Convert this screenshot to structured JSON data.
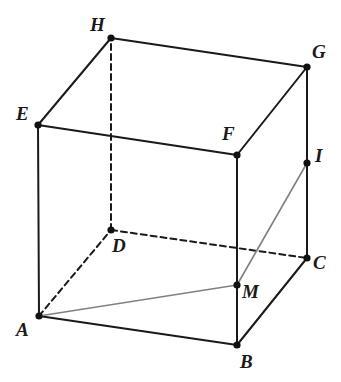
{
  "figure": {
    "width": 341,
    "height": 382,
    "background_color": "#ffffff",
    "solid_edge_color": "#1a1a1a",
    "hidden_edge_color": "#1a1a1a",
    "auxiliary_line_color": "#808080",
    "vertex_dot_color": "#111111",
    "label_color": "#1a1a1a"
  },
  "vertices": [
    {
      "id": "A",
      "label": "A",
      "x": 39,
      "y": 316,
      "label_x": 16,
      "label_y": 320,
      "dot": true
    },
    {
      "id": "B",
      "label": "B",
      "x": 237,
      "y": 345,
      "label_x": 240,
      "label_y": 352,
      "dot": true
    },
    {
      "id": "C",
      "label": "C",
      "x": 307,
      "y": 258,
      "label_x": 313,
      "label_y": 253,
      "dot": true
    },
    {
      "id": "D",
      "label": "D",
      "x": 111,
      "y": 230,
      "label_x": 112,
      "label_y": 236,
      "dot": true
    },
    {
      "id": "E",
      "label": "E",
      "x": 38,
      "y": 125,
      "label_x": 16,
      "label_y": 104,
      "dot": true
    },
    {
      "id": "F",
      "label": "F",
      "x": 237,
      "y": 155,
      "label_x": 222,
      "label_y": 124,
      "dot": true
    },
    {
      "id": "G",
      "label": "G",
      "x": 307,
      "y": 67,
      "label_x": 312,
      "label_y": 42,
      "dot": true
    },
    {
      "id": "H",
      "label": "H",
      "x": 111,
      "y": 38,
      "label_x": 90,
      "label_y": 15,
      "dot": true
    },
    {
      "id": "I",
      "label": "I",
      "x": 307,
      "y": 163,
      "label_x": 315,
      "label_y": 146,
      "dot": true
    },
    {
      "id": "M",
      "label": "M",
      "x": 237,
      "y": 285,
      "label_x": 242,
      "label_y": 282,
      "dot": true
    }
  ],
  "edges": {
    "solid": [
      {
        "name": "edge-A-B",
        "from": "A",
        "to": "B"
      },
      {
        "name": "edge-B-C",
        "from": "B",
        "to": "C"
      },
      {
        "name": "edge-A-E",
        "from": "A",
        "to": "E"
      },
      {
        "name": "edge-B-F",
        "from": "B",
        "to": "F"
      },
      {
        "name": "edge-C-G",
        "from": "C",
        "to": "G"
      },
      {
        "name": "edge-E-F",
        "from": "E",
        "to": "F"
      },
      {
        "name": "edge-F-G",
        "from": "F",
        "to": "G"
      },
      {
        "name": "edge-G-H",
        "from": "G",
        "to": "H"
      },
      {
        "name": "edge-H-E",
        "from": "H",
        "to": "E"
      }
    ],
    "dashed": [
      {
        "name": "edge-A-D",
        "from": "A",
        "to": "D"
      },
      {
        "name": "edge-D-C",
        "from": "D",
        "to": "C"
      },
      {
        "name": "edge-D-H",
        "from": "D",
        "to": "H"
      }
    ],
    "auxiliary": [
      {
        "name": "segment-A-M",
        "from": "A",
        "to": "M"
      },
      {
        "name": "segment-M-I",
        "from": "M",
        "to": "I"
      }
    ]
  },
  "stroke_widths": {
    "solid": 2.0,
    "dashed": 2.0,
    "auxiliary": 1.6,
    "dash_pattern": "6 4"
  },
  "dot_radius": 3.6
}
